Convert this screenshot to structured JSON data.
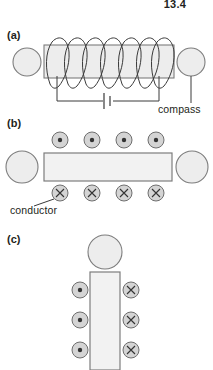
{
  "figure": {
    "running_head": "13.4",
    "background_color": "#ffffff",
    "ink_color": "#231f20",
    "fill_gray": "#ededed",
    "stroke_gray": "#7d7d7d",
    "symbol_fill": "#d4d4d4",
    "panels": [
      {
        "id": "a",
        "label": "(a)",
        "label_x": 7,
        "label_y": 39,
        "description": "Solenoid coil wound around a bar, connected to a battery circuit, with a compass on each side",
        "bar": {
          "x": 44,
          "y": 45,
          "width": 130,
          "height": 33
        },
        "coil_turns": 7,
        "compasses": [
          {
            "name": "compass-left",
            "cx": 27,
            "cy": 62,
            "r": 14
          },
          {
            "name": "compass-right",
            "cx": 191,
            "cy": 62,
            "r": 14
          }
        ],
        "circuit": {
          "left_x": 57,
          "right_x": 159,
          "top_y": 78,
          "bottom_y": 101,
          "battery_x": 108
        },
        "callout": {
          "text": "compass",
          "text_x": 158,
          "text_y": 112,
          "leader": {
            "x1": 191,
            "y1": 76,
            "x2": 191,
            "y2": 103
          }
        }
      },
      {
        "id": "b",
        "label": "(b)",
        "label_x": 7,
        "label_y": 127,
        "description": "Horizontal current-carrying conductor bar with field symbols: dots above, crosses below, and a compass at each end",
        "bar": {
          "x": 44,
          "y": 153,
          "width": 128,
          "height": 28
        },
        "compasses": [
          {
            "name": "compass-left",
            "cx": 22,
            "cy": 167,
            "r": 16
          },
          {
            "name": "compass-right",
            "cx": 192,
            "cy": 167,
            "r": 16
          }
        ],
        "symbols_top": [
          {
            "type": "dot",
            "cx": 60,
            "cy": 140,
            "r": 8
          },
          {
            "type": "dot",
            "cx": 92,
            "cy": 140,
            "r": 8
          },
          {
            "type": "dot",
            "cx": 124,
            "cy": 140,
            "r": 8
          },
          {
            "type": "dot",
            "cx": 156,
            "cy": 140,
            "r": 8
          }
        ],
        "symbols_bottom": [
          {
            "type": "cross",
            "cx": 60,
            "cy": 193,
            "r": 8
          },
          {
            "type": "cross",
            "cx": 92,
            "cy": 193,
            "r": 8
          },
          {
            "type": "cross",
            "cx": 124,
            "cy": 193,
            "r": 8
          },
          {
            "type": "cross",
            "cx": 156,
            "cy": 193,
            "r": 8
          }
        ],
        "callout": {
          "text": "conductor",
          "text_x": 10,
          "text_y": 214,
          "leader": {
            "x1": 54,
            "y1": 199,
            "x2": 35,
            "y2": 205
          }
        }
      },
      {
        "id": "c",
        "label": "(c)",
        "label_x": 7,
        "label_y": 243,
        "description": "Vertical current-carrying conductor with a compass above it, dots on the left side and crosses on the right side",
        "bar": {
          "x": 90,
          "y": 272,
          "width": 30,
          "height": 98
        },
        "compasses": [
          {
            "name": "compass-top",
            "cx": 105,
            "cy": 252,
            "r": 17
          }
        ],
        "symbols_left": [
          {
            "type": "dot",
            "cx": 80,
            "cy": 290,
            "r": 8
          },
          {
            "type": "dot",
            "cx": 80,
            "cy": 320,
            "r": 8
          },
          {
            "type": "dot",
            "cx": 80,
            "cy": 350,
            "r": 8
          }
        ],
        "symbols_right": [
          {
            "type": "cross",
            "cx": 131,
            "cy": 290,
            "r": 8
          },
          {
            "type": "cross",
            "cx": 131,
            "cy": 320,
            "r": 8
          },
          {
            "type": "cross",
            "cx": 131,
            "cy": 350,
            "r": 8
          }
        ]
      }
    ]
  }
}
